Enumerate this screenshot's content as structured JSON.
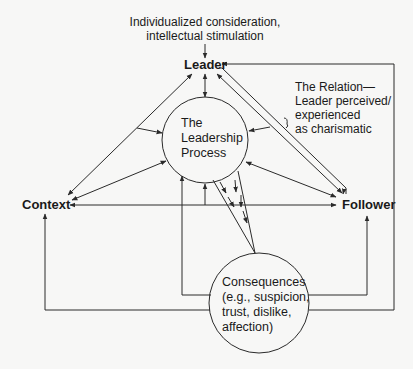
{
  "diagram": {
    "top_note": {
      "line1": "Individualized consideration,",
      "line2": "intellectual stimulation"
    },
    "nodes": {
      "leader": "Leader",
      "context": "Context",
      "follower": "Follower"
    },
    "process_circle": {
      "line1": "The",
      "line2": "Leadership",
      "line3": "Process"
    },
    "relation_note": {
      "line1": "The Relation—",
      "line2": "Leader perceived/",
      "line3": "experienced",
      "line4": "as charismatic"
    },
    "consequences_circle": {
      "line1": "Consequences",
      "line2": "(e.g., suspicion,",
      "line3": "trust, dislike,",
      "line4": "affection)"
    },
    "colors": {
      "line": "#2a2a2a",
      "background": "#f7f7f6",
      "text": "#1a1a1a"
    }
  }
}
